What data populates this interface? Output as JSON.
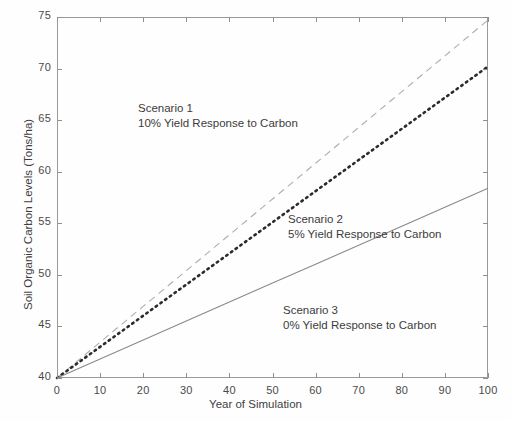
{
  "chart_data": {
    "type": "line",
    "title": "",
    "xlabel": "Year of Simulation",
    "ylabel": "Soil Organic Carbon Levels (Tons/ha)",
    "xlim": [
      0,
      100
    ],
    "ylim": [
      40,
      75
    ],
    "xticks": [
      0,
      10,
      20,
      30,
      40,
      50,
      60,
      70,
      80,
      90,
      100
    ],
    "yticks": [
      40,
      45,
      50,
      55,
      60,
      65,
      70,
      75
    ],
    "grid": false,
    "legend": "none (inline annotations)",
    "x": [
      0,
      10,
      20,
      30,
      40,
      50,
      60,
      70,
      80,
      90,
      100
    ],
    "series": [
      {
        "name": "Scenario 1",
        "description": "10% Yield Response to Carbon",
        "style": "dashed",
        "color": "#aeaeae",
        "values": [
          40.0,
          43.47,
          46.94,
          50.41,
          53.88,
          57.35,
          60.82,
          64.29,
          67.76,
          71.23,
          74.7
        ]
      },
      {
        "name": "Scenario 2",
        "description": "5% Yield Response to Carbon",
        "style": "dotted",
        "color": "#2b2b2b",
        "values": [
          40.0,
          43.02,
          46.04,
          49.06,
          52.08,
          55.1,
          58.12,
          61.14,
          64.16,
          67.18,
          70.2
        ]
      },
      {
        "name": "Scenario 3",
        "description": "0% Yield Response to Carbon",
        "style": "solid",
        "color": "#8a8a8a",
        "values": [
          40.0,
          41.84,
          43.68,
          45.52,
          47.36,
          49.2,
          51.04,
          52.88,
          54.72,
          56.56,
          58.4
        ]
      }
    ],
    "annotations": [
      {
        "id": "scenario-1",
        "line1": "Scenario 1",
        "line2": "10% Yield Response to Carbon"
      },
      {
        "id": "scenario-2",
        "line1": "Scenario 2",
        "line2": "5% Yield Response to Carbon"
      },
      {
        "id": "scenario-3",
        "line1": "Scenario 3",
        "line2": "0% Yield Response to Carbon"
      }
    ]
  }
}
